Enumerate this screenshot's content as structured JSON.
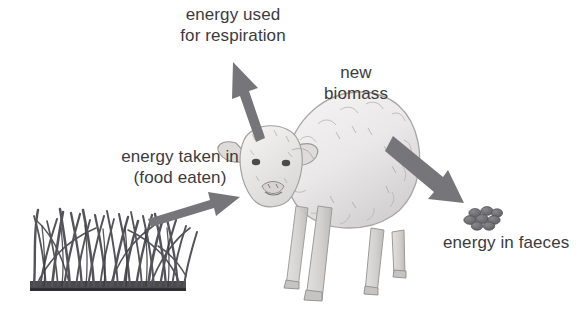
{
  "diagram": {
    "background_color": "#ffffff",
    "arrow_color": "#76767a",
    "text_color": "#3b3b3d",
    "grass_color": "#58585a",
    "faeces_color": "#6e6e72",
    "sheep_color": "#eceaea"
  },
  "labels": {
    "respiration_line1": "energy used",
    "respiration_line2": "for respiration",
    "taken_in_line1": "energy taken in",
    "taken_in_line2": "(food eaten)",
    "biomass_line1": "new",
    "biomass_line2": "biomass",
    "faeces": "energy in faeces"
  },
  "elements": {
    "grass_name": "grass",
    "sheep_name": "sheep",
    "faeces_name": "faeces pellets",
    "arrow_respiration_name": "arrow pointing up-left out of sheep",
    "arrow_intake_name": "arrow pointing right from grass to sheep",
    "arrow_faeces_name": "arrow pointing down-right to faeces"
  }
}
